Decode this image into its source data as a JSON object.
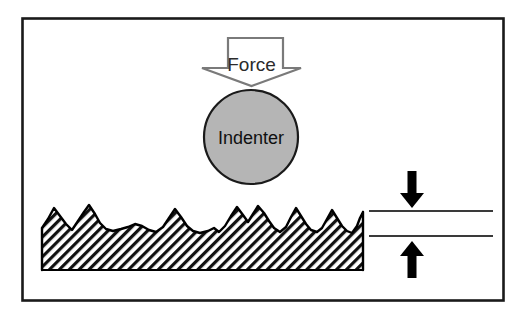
{
  "figure": {
    "background_color": "#ffffff",
    "border_color": "#1a1a1a"
  },
  "labels": {
    "force": "Force",
    "indenter": "Indenter"
  },
  "force_arrow": {
    "name": "force-arrow",
    "direction": "down",
    "fill_color": "#ffffff",
    "stroke_color": "#7a7a7a",
    "shaft": {
      "x1": 228,
      "x2": 283,
      "top": 38,
      "neck": 68
    },
    "head": {
      "left": 202,
      "right": 301,
      "tip_y": 86
    }
  },
  "indenter": {
    "name": "indenter-circle",
    "fill_color": "#b5b5b5",
    "stroke_color": "#1a1a1a",
    "center_x": 251,
    "center_y": 137,
    "radius": 47
  },
  "surface": {
    "name": "rough-surface",
    "description": "Hatched solid body with jagged asperity peaks",
    "hatch_color": "#111111",
    "hatch_angle_deg": 45,
    "outline_color": "#000000",
    "left_x": 42,
    "right_x": 363,
    "base_y": 270,
    "peak_band_top": 203,
    "valley_y": 233,
    "profile": [
      [
        42,
        228
      ],
      [
        48,
        219
      ],
      [
        54,
        208
      ],
      [
        60,
        216
      ],
      [
        66,
        224
      ],
      [
        72,
        230
      ],
      [
        78,
        221
      ],
      [
        84,
        212
      ],
      [
        89,
        205
      ],
      [
        95,
        214
      ],
      [
        100,
        223
      ],
      [
        106,
        229
      ],
      [
        113,
        231
      ],
      [
        121,
        229
      ],
      [
        128,
        227
      ],
      [
        135,
        224
      ],
      [
        142,
        226
      ],
      [
        149,
        230
      ],
      [
        156,
        232
      ],
      [
        163,
        227
      ],
      [
        169,
        218
      ],
      [
        175,
        209
      ],
      [
        181,
        217
      ],
      [
        187,
        226
      ],
      [
        193,
        231
      ],
      [
        200,
        233
      ],
      [
        208,
        231
      ],
      [
        214,
        228
      ],
      [
        219,
        232
      ],
      [
        225,
        226
      ],
      [
        231,
        216
      ],
      [
        237,
        207
      ],
      [
        243,
        215
      ],
      [
        248,
        222
      ],
      [
        253,
        214
      ],
      [
        258,
        206
      ],
      [
        264,
        213
      ],
      [
        269,
        221
      ],
      [
        274,
        228
      ],
      [
        280,
        232
      ],
      [
        286,
        227
      ],
      [
        291,
        217
      ],
      [
        296,
        208
      ],
      [
        301,
        216
      ],
      [
        306,
        224
      ],
      [
        311,
        230
      ],
      [
        317,
        232
      ],
      [
        322,
        228
      ],
      [
        327,
        219
      ],
      [
        332,
        210
      ],
      [
        337,
        218
      ],
      [
        342,
        226
      ],
      [
        347,
        231
      ],
      [
        352,
        233
      ],
      [
        357,
        226
      ],
      [
        360,
        218
      ],
      [
        363,
        212
      ]
    ]
  },
  "measurement": {
    "name": "depth-measurement",
    "line_color": "#3a3a3a",
    "arrow_color": "#000000",
    "line_left_x": 369,
    "line_right_x": 493,
    "upper_line_y": 211,
    "lower_line_y": 236,
    "arrow_x": 412,
    "down_arrow": {
      "top_y": 171,
      "bottom_y": 207
    },
    "up_arrow": {
      "top_y": 241,
      "bottom_y": 277
    }
  }
}
